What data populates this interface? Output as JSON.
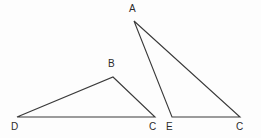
{
  "figure": {
    "canvas": {
      "width": 261,
      "height": 138
    },
    "background_color": "#fdfdfd",
    "stroke_color": "#3a3a3a",
    "stroke_width": 1.1,
    "label_color": "#2b2b2b"
  },
  "shapes": {
    "left_triangle": {
      "name": "triangle-DBC",
      "vertices": [
        {
          "label": "D",
          "x": 17,
          "y": 117,
          "label_x": 11,
          "label_y": 122
        },
        {
          "label": "B",
          "x": 113,
          "y": 77,
          "label_x": 108,
          "label_y": 59
        },
        {
          "label": "C",
          "x": 155,
          "y": 117,
          "label_x": 149,
          "label_y": 122
        }
      ],
      "path": "M 17 117 L 113 77 L 155 117 Z"
    },
    "right_triangle": {
      "name": "triangle-AEC",
      "vertices": [
        {
          "label": "A",
          "x": 134,
          "y": 21,
          "label_x": 129,
          "label_y": 4
        },
        {
          "label": "E",
          "x": 172,
          "y": 117,
          "label_x": 166,
          "label_y": 122
        },
        {
          "label": "C",
          "x": 240,
          "y": 117,
          "label_x": 236,
          "label_y": 122
        }
      ],
      "path": "M 134 21 L 172 117 L 240 117 Z"
    }
  },
  "labels": {
    "left_D": "D",
    "left_B": "B",
    "left_C": "C",
    "right_A": "A",
    "right_E": "E",
    "right_C": "C"
  }
}
